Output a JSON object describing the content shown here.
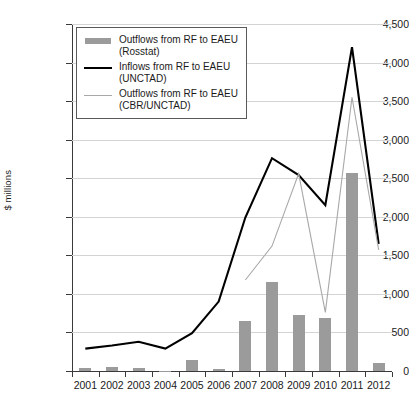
{
  "chart_data": {
    "type": "bar",
    "title": "",
    "subtitle": "",
    "xlabel": "",
    "ylabel": "$ millions",
    "categories": [
      "2001",
      "2002",
      "2003",
      "2004",
      "2005",
      "2006",
      "2007",
      "2008",
      "2009",
      "2010",
      "2011",
      "2012"
    ],
    "ylim": [
      0,
      4500
    ],
    "ytick_values": [
      0,
      500,
      1000,
      1500,
      2000,
      2500,
      3000,
      3500,
      4000,
      4500
    ],
    "ytick_labels": [
      "0",
      "500",
      "1,000",
      "1,500",
      "2,000",
      "2,500",
      "3,000",
      "3,500",
      "4,000",
      "4,500"
    ],
    "grid": true,
    "legend_position": "upper-left-inside",
    "series": [
      {
        "name": "Outflows from RF to EAEU (Rosstat)",
        "type": "bar",
        "color": "#9b9b9b",
        "values": [
          45,
          55,
          45,
          5,
          140,
          20,
          650,
          1150,
          720,
          685,
          2570,
          105
        ]
      },
      {
        "name": "Inflows from RF to EAEU (UNCTAD)",
        "type": "line",
        "color": "#000000",
        "values": [
          290,
          330,
          380,
          290,
          490,
          900,
          1990,
          2760,
          2540,
          2150,
          4200,
          1650
        ]
      },
      {
        "name": "Outflows from RF to EAEU (CBR/UNCTAD)",
        "type": "line",
        "color": "#a8a8a8",
        "values": [
          null,
          null,
          null,
          null,
          null,
          null,
          1180,
          1620,
          2560,
          760,
          3550,
          1570
        ]
      }
    ]
  },
  "legend": {
    "items": [
      {
        "key": "bar-swatch",
        "line1": "Outflows from RF to EAEU",
        "line2": "(Rosstat)"
      },
      {
        "key": "line-dark-swatch",
        "line1": "Inflows from RF to EAEU",
        "line2": "(UNCTAD)"
      },
      {
        "key": "line-gray-swatch",
        "line1": "Outflows from RF to EAEU",
        "line2": "(CBR/UNCTAD)"
      }
    ]
  },
  "axis": {
    "y_title": "$ millions"
  },
  "colors": {
    "bar": "#9b9b9b",
    "line_dark": "#000000",
    "line_gray": "#a8a8a8",
    "grid": "#d4d4d4",
    "axis": "#3a3a3a",
    "background": "#ffffff"
  }
}
